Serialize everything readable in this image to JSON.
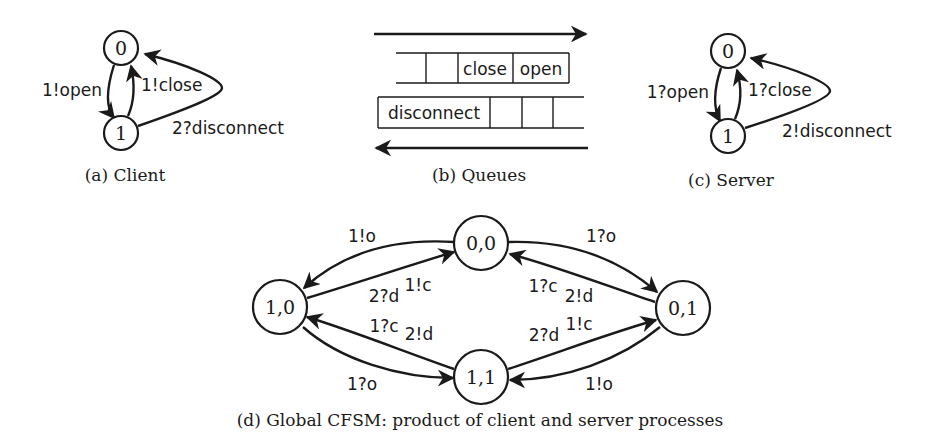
{
  "client": {
    "caption": "(a) Client",
    "states": [
      "0",
      "1"
    ],
    "edges": {
      "open": "1!open",
      "close": "1!close",
      "disconnect": "2?disconnect"
    }
  },
  "queues": {
    "caption": "(b) Queues",
    "top_queue": [
      "",
      "",
      "close",
      "open"
    ],
    "bottom_queue": [
      "disconnect",
      "",
      "",
      ""
    ]
  },
  "server": {
    "caption": "(c) Server",
    "states": [
      "0",
      "1"
    ],
    "edges": {
      "open": "1?open",
      "close": "1?close",
      "disconnect": "2!disconnect"
    }
  },
  "global": {
    "caption": "(d) Global CFSM: product of client and server processes",
    "states": {
      "s00": "0,0",
      "s10": "1,0",
      "s01": "0,1",
      "s11": "1,1"
    },
    "labels": {
      "s00_s10": "1!o",
      "s10_s00_a": "2?d",
      "s10_s00_b": "1!c",
      "s00_s01": "1?o",
      "s01_s00_a": "1?c",
      "s01_s00_b": "2!d",
      "s11_s10_a": "1?c",
      "s11_s10_b": "2!d",
      "s10_s11": "1?o",
      "s11_s01_a": "2?d",
      "s11_s01_b": "1!c",
      "s01_s11": "1!o"
    }
  }
}
